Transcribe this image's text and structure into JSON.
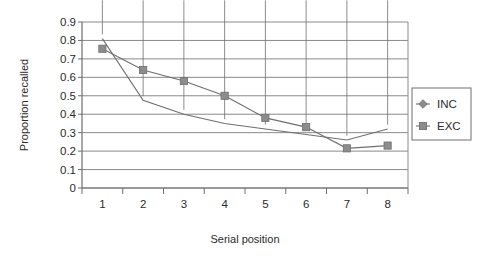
{
  "chart_data": {
    "type": "line",
    "title": "",
    "xlabel": "Serial position",
    "ylabel": "Proportion recalled",
    "categories": [
      "1",
      "2",
      "3",
      "4",
      "5",
      "6",
      "7",
      "8"
    ],
    "ytick_labels": [
      "0.9",
      "0.8",
      "0.7",
      "0.6",
      "0.5",
      "0.4",
      "0.3",
      "0.2",
      "0.1",
      "0"
    ],
    "ytick_values": [
      0.9,
      0.8,
      0.7,
      0.6,
      0.5,
      0.4,
      0.3,
      0.2,
      0.1,
      0
    ],
    "ylim": [
      0,
      0.9
    ],
    "grid": "horizontal",
    "legend_position": "right",
    "series": [
      {
        "name": "INC",
        "marker": "diamond",
        "color": "#8c8c8c",
        "values": [
          0.81,
          0.475,
          0.4,
          0.35,
          0.32,
          0.29,
          0.26,
          0.32
        ]
      },
      {
        "name": "EXC",
        "marker": "square",
        "color": "#8c8c8c",
        "values": [
          0.755,
          0.64,
          0.58,
          0.5,
          0.38,
          0.33,
          0.215,
          0.23
        ]
      }
    ]
  },
  "legend": {
    "items": [
      {
        "label": "INC",
        "marker": "diamond-marker-icon"
      },
      {
        "label": "EXC",
        "marker": "square-marker-icon"
      }
    ]
  },
  "colors": {
    "series_grey": "#8c8c8c",
    "axis": "#6e6e6e",
    "gridline": "#8a8a8a",
    "text": "#2b2b2b",
    "background": "#ffffff"
  }
}
